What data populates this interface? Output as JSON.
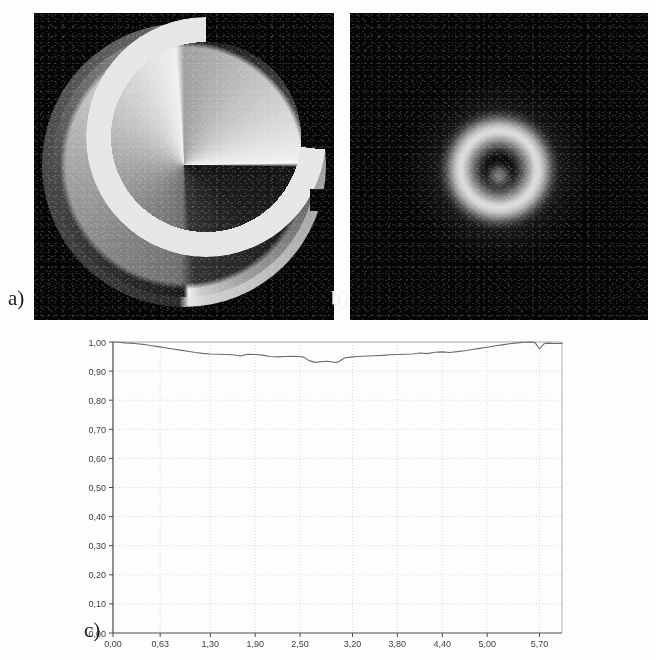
{
  "figure": {
    "panels": [
      {
        "id": "a",
        "label": "a)",
        "kind": "image",
        "description": "spiral-phase-mask"
      },
      {
        "id": "b",
        "label": "b)",
        "kind": "image",
        "description": "vortex-beam-intensity"
      },
      {
        "id": "c",
        "label": "c)",
        "kind": "chart",
        "description": "normalized-intensity-profile"
      }
    ]
  },
  "chart_data": {
    "type": "line",
    "title": "",
    "xlabel": "",
    "ylabel": "",
    "xlim": [
      0.0,
      6.0
    ],
    "ylim": [
      0.0,
      1.0
    ],
    "grid": true,
    "legend": null,
    "decimal_separator": ",",
    "x_tick_labels": [
      "0,00",
      "0,63",
      "1,30",
      "1,90",
      "2,50",
      "3,20",
      "3,80",
      "4,40",
      "5,00",
      "5,70"
    ],
    "x_tick_values": [
      0.0,
      0.63,
      1.3,
      1.9,
      2.5,
      3.2,
      3.8,
      4.4,
      5.0,
      5.7
    ],
    "y_tick_labels": [
      "0,00",
      "0,10",
      "0,20",
      "0,30",
      "0,40",
      "0,50",
      "0,60",
      "0,70",
      "0,80",
      "0,90",
      "1,00"
    ],
    "y_tick_values": [
      0.0,
      0.1,
      0.2,
      0.3,
      0.4,
      0.5,
      0.6,
      0.7,
      0.8,
      0.9,
      1.0
    ],
    "series": [
      {
        "name": "profile",
        "color": "#6b6b6b",
        "x": [
          0.0,
          0.08,
          0.16,
          0.24,
          0.32,
          0.4,
          0.5,
          0.6,
          0.7,
          0.8,
          0.9,
          1.0,
          1.1,
          1.2,
          1.3,
          1.4,
          1.5,
          1.6,
          1.7,
          1.8,
          1.9,
          2.0,
          2.1,
          2.2,
          2.3,
          2.4,
          2.5,
          2.55,
          2.62,
          2.7,
          2.78,
          2.86,
          2.94,
          3.0,
          3.05,
          3.1,
          3.18,
          3.26,
          3.34,
          3.42,
          3.5,
          3.6,
          3.7,
          3.8,
          3.9,
          4.0,
          4.1,
          4.2,
          4.3,
          4.4,
          4.5,
          4.6,
          4.7,
          4.8,
          4.9,
          5.0,
          5.1,
          5.2,
          5.3,
          5.4,
          5.5,
          5.58,
          5.64,
          5.7,
          5.76,
          5.82,
          5.9,
          6.0
        ],
        "y": [
          1.0,
          0.999,
          0.997,
          0.996,
          0.994,
          0.992,
          0.988,
          0.984,
          0.98,
          0.976,
          0.972,
          0.968,
          0.964,
          0.961,
          0.959,
          0.958,
          0.957,
          0.956,
          0.952,
          0.958,
          0.957,
          0.955,
          0.95,
          0.949,
          0.95,
          0.951,
          0.95,
          0.948,
          0.936,
          0.93,
          0.932,
          0.934,
          0.931,
          0.93,
          0.938,
          0.946,
          0.948,
          0.95,
          0.951,
          0.952,
          0.953,
          0.954,
          0.956,
          0.957,
          0.958,
          0.959,
          0.962,
          0.96,
          0.965,
          0.966,
          0.964,
          0.967,
          0.97,
          0.974,
          0.978,
          0.982,
          0.986,
          0.99,
          0.994,
          0.997,
          0.999,
          1.0,
          0.998,
          0.976,
          0.994,
          0.996,
          0.995,
          0.995
        ]
      }
    ]
  }
}
